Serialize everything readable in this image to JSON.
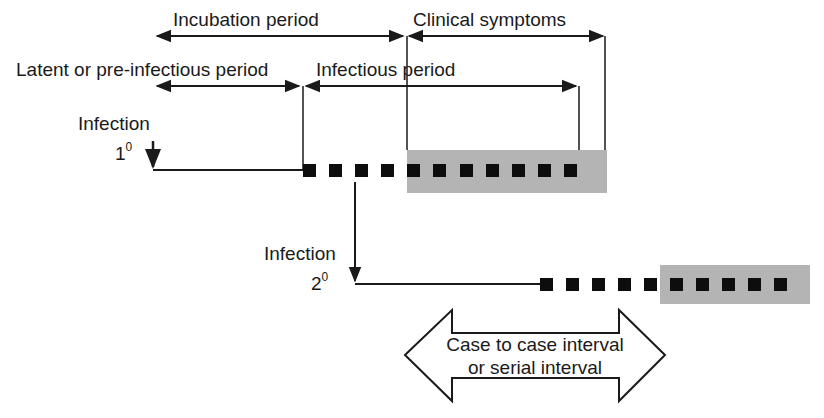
{
  "diagram": {
    "labels": {
      "incubation": "Incubation period",
      "clinical": "Clinical symptoms",
      "latent": "Latent or pre-infectious period",
      "infectious": "Infectious period",
      "infection1_word": "Infection",
      "infection1_num": "1",
      "infection1_sup": "0",
      "infection2_word": "Infection",
      "infection2_num": "2",
      "infection2_sup": "0",
      "serial_line1": "Case to case interval",
      "serial_line2": "or serial interval"
    },
    "colors": {
      "line": "#1a1a1a",
      "symptom_box": "#b4b4b4",
      "dot": "#0d0d0d"
    }
  }
}
